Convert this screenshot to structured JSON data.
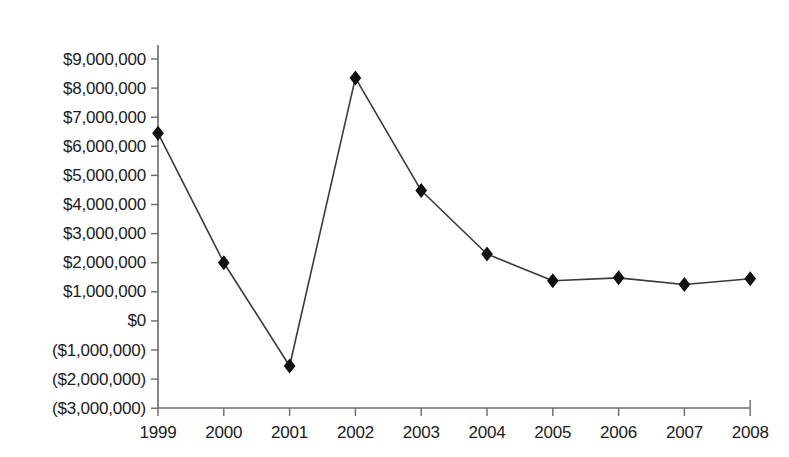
{
  "chart_data": {
    "type": "line",
    "title": "",
    "subtitle": "",
    "xlabel": "",
    "ylabel": "",
    "categories": [
      "1999",
      "2000",
      "2001",
      "2002",
      "2003",
      "2004",
      "2005",
      "2006",
      "2007",
      "2008"
    ],
    "x": [
      1999,
      2000,
      2001,
      2002,
      2003,
      2004,
      2005,
      2006,
      2007,
      2008
    ],
    "values": [
      6450000,
      2000000,
      -1550000,
      8350000,
      4480000,
      2300000,
      1380000,
      1480000,
      1250000,
      1450000
    ],
    "series": [
      {
        "name": "",
        "values": [
          6450000,
          2000000,
          -1550000,
          8350000,
          4480000,
          2300000,
          1380000,
          1480000,
          1250000,
          1450000
        ]
      }
    ],
    "ylim": [
      -3000000,
      9000000
    ],
    "ytick_values": [
      9000000,
      8000000,
      7000000,
      6000000,
      5000000,
      4000000,
      3000000,
      2000000,
      1000000,
      0,
      -1000000,
      -2000000,
      -3000000
    ],
    "ytick_labels": [
      "$9,000,000",
      "$8,000,000",
      "$7,000,000",
      "$6,000,000",
      "$5,000,000",
      "$4,000,000",
      "$3,000,000",
      "$2,000,000",
      "$1,000,000",
      "$0",
      "($1,000,000)",
      "($2,000,000)",
      "($3,000,000)"
    ],
    "xtick_labels": [
      "1999",
      "2000",
      "2001",
      "2002",
      "2003",
      "2004",
      "2005",
      "2006",
      "2007",
      "2008"
    ],
    "grid": false,
    "legend": false,
    "legend_position": "none",
    "marker": "diamond",
    "annotations": []
  },
  "style": {
    "line_color": "#3a3a3a",
    "marker_color": "#111111",
    "axis_color": "#6a6a6a",
    "text_color": "#1b1b1b",
    "background": "#ffffff"
  },
  "icons": {
    "marker": "diamond-marker-icon"
  }
}
